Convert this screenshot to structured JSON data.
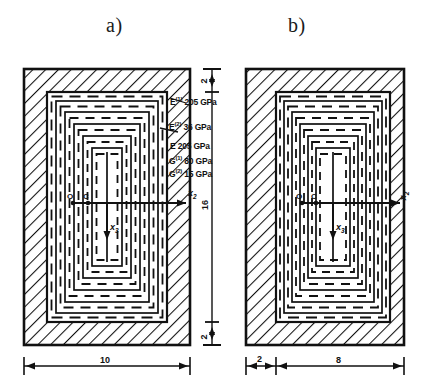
{
  "figure": {
    "kind": "engineering-cross-section-diagram",
    "ink_color": "#111111",
    "paper_color": "#ffffff"
  },
  "panels": [
    {
      "id": "a",
      "title": "a)",
      "origin_label": "O",
      "centroid_label": "C",
      "axis_horizontal": "x",
      "axis_horizontal_sub": "2",
      "axis_vertical": "x",
      "axis_vertical_sub": "3",
      "symmetric": true
    },
    {
      "id": "b",
      "title": "b)",
      "origin_label": "O",
      "centroid_label": "C",
      "axis_horizontal": "x",
      "axis_horizontal_sub": "2",
      "axis_vertical": "x",
      "axis_vertical_sub": "3",
      "symmetric": false
    }
  ],
  "material_labels": [
    {
      "symbol": "E",
      "superscript": "(1)",
      "value": "205",
      "unit": "GPa"
    },
    {
      "symbol": "E",
      "superscript": "(2)",
      "value": "36",
      "unit": "GPa"
    },
    {
      "symbol": "E",
      "superscript": "",
      "value": "205",
      "unit": "GPa"
    },
    {
      "symbol": "G",
      "superscript": "(1)",
      "value": "80",
      "unit": "GPa"
    },
    {
      "symbol": "G",
      "superscript": "(2)",
      "value": "15",
      "unit": "GPa"
    }
  ],
  "dimensions": {
    "vertical": [
      {
        "value": "2",
        "position": "top"
      },
      {
        "value": "16",
        "position": "middle"
      },
      {
        "value": "2",
        "position": "bottom"
      }
    ],
    "horizontal_a": [
      {
        "value": "10",
        "span": "full-width"
      }
    ],
    "horizontal_b": [
      {
        "value": "2",
        "span": "left-wall"
      },
      {
        "value": "8",
        "span": "remainder"
      }
    ]
  }
}
